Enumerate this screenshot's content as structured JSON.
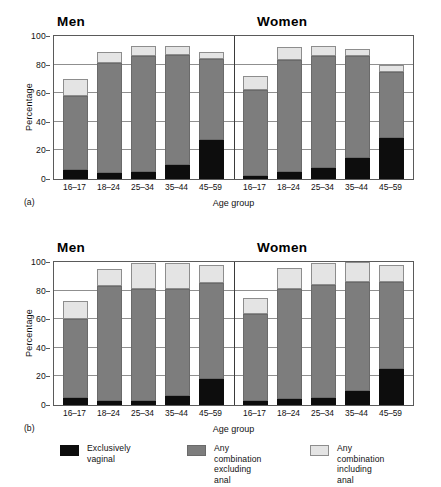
{
  "chart_data": [
    {
      "panel": "(a)",
      "type": "bar",
      "stacked": true,
      "title_left": "Men",
      "title_right": "Women",
      "xlabel": "Age group",
      "ylabel": "Percentage",
      "ylim": [
        0,
        100
      ],
      "yticks": [
        0,
        20,
        40,
        60,
        80,
        100
      ],
      "grid": true,
      "categories": [
        "16–17",
        "18–24",
        "25–34",
        "35–44",
        "45–59"
      ],
      "groups": [
        {
          "name": "Men",
          "series": [
            {
              "name": "Exclusively vaginal",
              "values": [
                6,
                4,
                5,
                10,
                27
              ]
            },
            {
              "name": "Any combination excluding anal",
              "values": [
                52,
                77,
                81,
                77,
                57
              ]
            },
            {
              "name": "Any combination including anal",
              "values": [
                12,
                8,
                7,
                6,
                5
              ]
            }
          ],
          "totals": [
            70,
            89,
            93,
            93,
            89
          ]
        },
        {
          "name": "Women",
          "series": [
            {
              "name": "Exclusively vaginal",
              "values": [
                2,
                5,
                8,
                15,
                29
              ]
            },
            {
              "name": "Any combination excluding anal",
              "values": [
                60,
                78,
                78,
                71,
                46
              ]
            },
            {
              "name": "Any combination including anal",
              "values": [
                10,
                9,
                7,
                5,
                5
              ]
            }
          ],
          "totals": [
            72,
            92,
            93,
            91,
            80
          ]
        }
      ]
    },
    {
      "panel": "(b)",
      "type": "bar",
      "stacked": true,
      "title_left": "Men",
      "title_right": "Women",
      "xlabel": "Age group",
      "ylabel": "Percentage",
      "ylim": [
        0,
        100
      ],
      "yticks": [
        0,
        20,
        40,
        60,
        80,
        100
      ],
      "grid": true,
      "categories": [
        "16–17",
        "18–24",
        "25–34",
        "35–44",
        "45–59"
      ],
      "groups": [
        {
          "name": "Men",
          "series": [
            {
              "name": "Exclusively vaginal",
              "values": [
                5,
                3,
                3,
                6,
                18
              ]
            },
            {
              "name": "Any combination excluding anal",
              "values": [
                55,
                80,
                78,
                75,
                67
              ]
            },
            {
              "name": "Any combination including anal",
              "values": [
                13,
                12,
                18,
                18,
                13
              ]
            }
          ],
          "totals": [
            73,
            95,
            99,
            99,
            98
          ]
        },
        {
          "name": "Women",
          "series": [
            {
              "name": "Exclusively vaginal",
              "values": [
                3,
                4,
                5,
                10,
                25
              ]
            },
            {
              "name": "Any combination excluding anal",
              "values": [
                61,
                77,
                79,
                76,
                61
              ]
            },
            {
              "name": "Any combination including anal",
              "values": [
                11,
                15,
                15,
                14,
                12
              ]
            }
          ],
          "totals": [
            75,
            96,
            99,
            100,
            98
          ]
        }
      ]
    }
  ],
  "legend": {
    "items": [
      {
        "label": "Exclusively vaginal",
        "color": "#0d0d0d",
        "key": "black"
      },
      {
        "label": "Any combination\nexcluding anal",
        "color": "#7d7d7d",
        "key": "grey"
      },
      {
        "label": "Any combination\nincluding anal",
        "color": "#e4e4e4",
        "key": "light"
      }
    ]
  },
  "colors": {
    "exclusively_vaginal": "#0d0d0d",
    "combination_excluding_anal": "#7d7d7d",
    "combination_including_anal": "#e4e4e4",
    "axis": "#5a5a5a",
    "grid": "#8f8f8f",
    "background": "#ffffff"
  }
}
